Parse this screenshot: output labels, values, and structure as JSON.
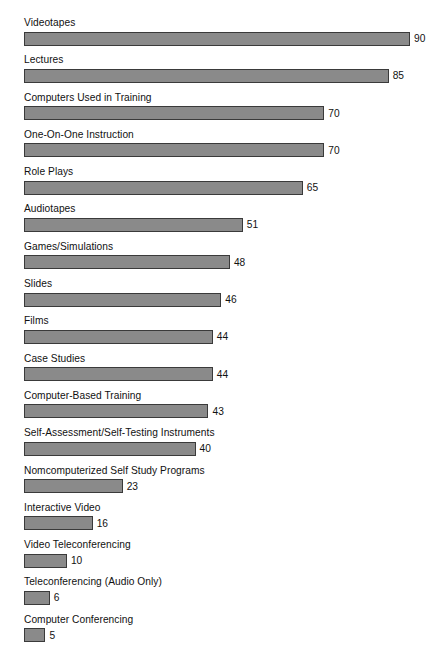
{
  "chart_data": {
    "type": "bar",
    "orientation": "horizontal",
    "title": "",
    "subtitle": "",
    "xlabel": "",
    "ylabel": "",
    "xlim": [
      0,
      90
    ],
    "grid": false,
    "legend": null,
    "bar_color": "#8a8a8a",
    "bar_border_color": "#3a3a3a",
    "background_color": "#ffffff",
    "text_color": "#111111",
    "value_label_position": "outside-end",
    "category_label_position": "above-bar",
    "categories": [
      "Videotapes",
      "Lectures",
      "Computers Used in Training",
      "One-On-One Instruction",
      "Role Plays",
      "Audiotapes",
      "Games/Simulations",
      "Slides",
      "Films",
      "Case Studies",
      "Computer-Based Training",
      "Self-Assessment/Self-Testing Instruments",
      "Nomcomputerized Self Study Programs",
      "Interactive Video",
      "Video Teleconferencing",
      "Teleconferencing (Audio Only)",
      "Computer Conferencing"
    ],
    "values": [
      90,
      85,
      70,
      70,
      65,
      51,
      48,
      46,
      44,
      44,
      43,
      40,
      23,
      16,
      10,
      6,
      5
    ],
    "rows": [
      {
        "label": "Videotapes",
        "value": 90,
        "value_text": "90"
      },
      {
        "label": "Lectures",
        "value": 85,
        "value_text": "85"
      },
      {
        "label": "Computers Used in Training",
        "value": 70,
        "value_text": "70"
      },
      {
        "label": "One-On-One Instruction",
        "value": 70,
        "value_text": "70"
      },
      {
        "label": "Role Plays",
        "value": 65,
        "value_text": "65"
      },
      {
        "label": "Audiotapes",
        "value": 51,
        "value_text": "51"
      },
      {
        "label": "Games/Simulations",
        "value": 48,
        "value_text": "48"
      },
      {
        "label": "Slides",
        "value": 46,
        "value_text": "46"
      },
      {
        "label": "Films",
        "value": 44,
        "value_text": "44"
      },
      {
        "label": "Case Studies",
        "value": 44,
        "value_text": "44"
      },
      {
        "label": "Computer-Based Training",
        "value": 43,
        "value_text": "43"
      },
      {
        "label": "Self-Assessment/Self-Testing Instruments",
        "value": 40,
        "value_text": "40"
      },
      {
        "label": "Nomcomputerized Self Study Programs",
        "value": 23,
        "value_text": "23"
      },
      {
        "label": "Interactive Video",
        "value": 16,
        "value_text": "16"
      },
      {
        "label": "Video Teleconferencing",
        "value": 10,
        "value_text": "10"
      },
      {
        "label": "Teleconferencing (Audio Only)",
        "value": 6,
        "value_text": "6"
      },
      {
        "label": "Computer Conferencing",
        "value": 5,
        "value_text": "5"
      }
    ],
    "scale": {
      "pixels_per_unit": 4.29,
      "min_bar_pixels": 21,
      "bar_origin_x": 24
    }
  }
}
